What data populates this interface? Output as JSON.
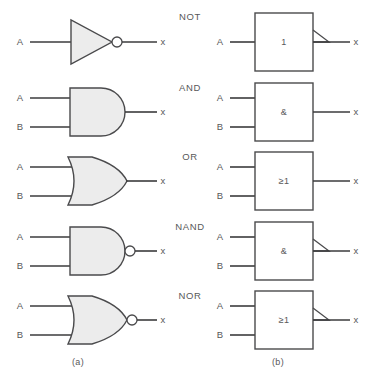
{
  "figure": {
    "style": {
      "line_color": "#3b3b3d",
      "gate_fill": "#ececec",
      "gate_stroke": "#4a4a4c",
      "text_color": "#58585a",
      "background": "#ffffff"
    },
    "captions": [
      {
        "id": "caption-a",
        "label": "(a)",
        "x": 78,
        "y": 362
      },
      {
        "id": "caption-b",
        "label": "(b)",
        "x": 278,
        "y": 362
      }
    ],
    "rows": [
      {
        "id": "not",
        "operation": "NOT",
        "op_label_x": 190,
        "op_label_y": 17,
        "center_y": 42,
        "inputs": [
          {
            "label": "A",
            "y": 42
          }
        ],
        "output": {
          "label": "x",
          "y": 42
        },
        "distinctive": {
          "left_shape": "triangle-with-bubble",
          "right_inner_text": "1",
          "right_has_negation_wedge": true
        }
      },
      {
        "id": "and",
        "operation": "AND",
        "op_label_x": 190,
        "op_label_y": 88,
        "center_y": 112,
        "inputs": [
          {
            "label": "A",
            "y": 98
          },
          {
            "label": "B",
            "y": 127
          }
        ],
        "output": {
          "label": "x",
          "y": 112
        },
        "distinctive": {
          "left_shape": "and-d-shape",
          "right_inner_text": "&",
          "right_has_negation_wedge": false
        }
      },
      {
        "id": "or",
        "operation": "OR",
        "op_label_x": 190,
        "op_label_y": 157,
        "center_y": 181,
        "inputs": [
          {
            "label": "A",
            "y": 167
          },
          {
            "label": "B",
            "y": 196
          }
        ],
        "output": {
          "label": "x",
          "y": 181
        },
        "distinctive": {
          "left_shape": "or-shield-shape",
          "right_inner_text": "≥1",
          "right_has_negation_wedge": false
        }
      },
      {
        "id": "nand",
        "operation": "NAND",
        "op_label_x": 190,
        "op_label_y": 227,
        "center_y": 251,
        "inputs": [
          {
            "label": "A",
            "y": 237
          },
          {
            "label": "B",
            "y": 266
          }
        ],
        "output": {
          "label": "x",
          "y": 251
        },
        "distinctive": {
          "left_shape": "and-d-shape-with-bubble",
          "right_inner_text": "&",
          "right_has_negation_wedge": true
        }
      },
      {
        "id": "nor",
        "operation": "NOR",
        "op_label_x": 190,
        "op_label_y": 296,
        "center_y": 320,
        "inputs": [
          {
            "label": "A",
            "y": 306
          },
          {
            "label": "B",
            "y": 335
          }
        ],
        "output": {
          "label": "x",
          "y": 320
        },
        "distinctive": {
          "left_shape": "or-shield-shape-with-bubble",
          "right_inner_text": "≥1",
          "right_has_negation_wedge": true
        }
      }
    ],
    "geometry": {
      "left_label_x": 20,
      "left_wire_start_x": 30,
      "left_body_x": 70,
      "left_out_label_x": 163,
      "right_label_x": 220,
      "right_wire_start_x": 230,
      "right_box_x": 255,
      "right_box_w": 58,
      "right_out_label_x": 356
    }
  }
}
